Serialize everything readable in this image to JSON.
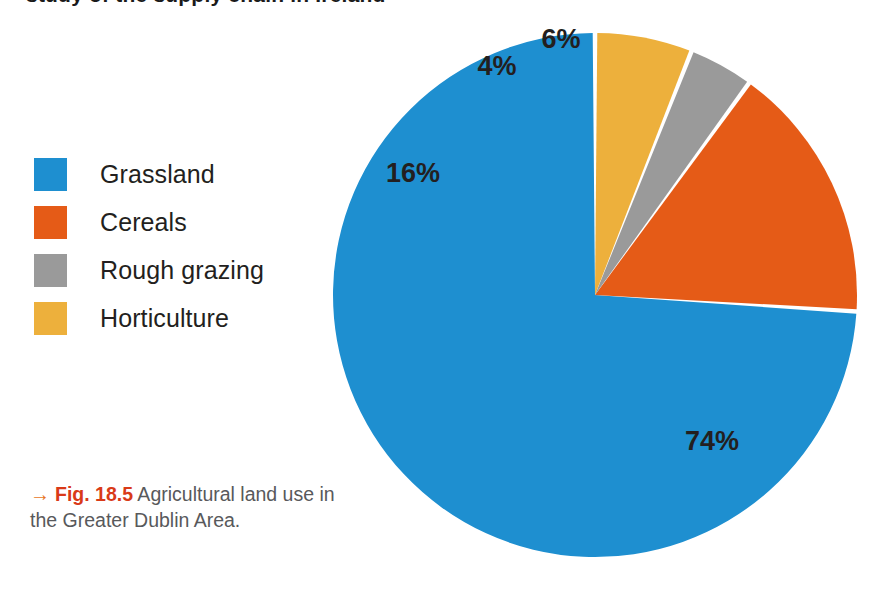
{
  "page": {
    "cropped_heading": "study of the supply chain in Ireland",
    "background_color": "#ffffff"
  },
  "legend": {
    "items": [
      {
        "label": "Grassland",
        "color": "#1e8fd0"
      },
      {
        "label": "Cereals",
        "color": "#e55b17"
      },
      {
        "label": "Rough grazing",
        "color": "#9a9a9a"
      },
      {
        "label": "Horticulture",
        "color": "#edb03c"
      }
    ]
  },
  "caption": {
    "arrow": "→",
    "figure_number": "Fig. 18.5",
    "text": " Agricultural land use in the Greater Dublin Area."
  },
  "chart_data": {
    "type": "pie",
    "title": "Agricultural land use in the Greater Dublin Area",
    "categories": [
      "Grassland",
      "Cereals",
      "Rough grazing",
      "Horticulture"
    ],
    "values": [
      74,
      16,
      4,
      6
    ],
    "value_labels": [
      "74%",
      "16%",
      "4%",
      "6%"
    ],
    "colors": [
      "#1e8fd0",
      "#e55b17",
      "#9a9a9a",
      "#edb03c"
    ],
    "unit": "%",
    "start_angle_deg": 0,
    "direction": "counterclockwise",
    "legend_position": "left",
    "grid": false,
    "geometry": {
      "cx": 595,
      "cy": 295,
      "r": 262,
      "gap_deg": 1.0
    },
    "label_positions": [
      {
        "category": "Grassland",
        "x": 712,
        "y": 450
      },
      {
        "category": "Cereals",
        "x": 413,
        "y": 182
      },
      {
        "category": "Rough grazing",
        "x": 497,
        "y": 75
      },
      {
        "category": "Horticulture",
        "x": 561,
        "y": 48
      }
    ]
  }
}
